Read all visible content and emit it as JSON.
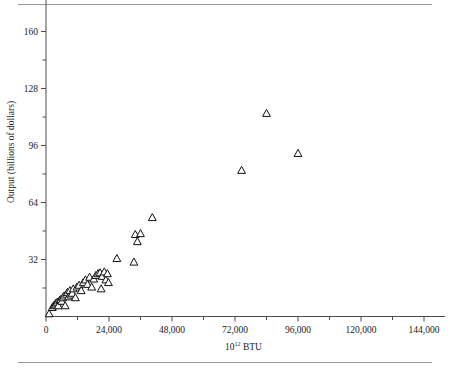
{
  "figure": {
    "has_top_rule": true,
    "has_bottom_rule": true,
    "rule_color": "#9a9a9a",
    "background": "#ffffff"
  },
  "chart_data": {
    "type": "scatter",
    "title": "",
    "subtitle": "",
    "xlabel": "10¹² BTU",
    "xlabel_base": "10",
    "xlabel_exponent": "12",
    "xlabel_unit": "BTU",
    "ylabel": "Output (billions of dollars)",
    "xlim": [
      0,
      152000
    ],
    "ylim": [
      0,
      178
    ],
    "grid": false,
    "legend": null,
    "marker": "open-triangle",
    "marker_fill": "#ffffff",
    "marker_stroke": "#111111",
    "axis_color": "#4d4d4d",
    "xticks": [
      0,
      24000,
      48000,
      72000,
      96000,
      120000,
      144000
    ],
    "xtick_labels": [
      "0",
      "24,000",
      "48,000",
      "72,000",
      "96,000",
      "120,000",
      "144,000"
    ],
    "xticks_minor": [
      12000,
      36000,
      60000,
      84000,
      108000,
      132000
    ],
    "yticks": [
      32,
      64,
      96,
      128,
      160
    ],
    "ytick_labels": [
      "32",
      "64",
      "96",
      "128",
      "160"
    ],
    "yticks_minor": [
      16,
      48,
      80,
      112,
      144
    ],
    "points": [
      {
        "x": 1200,
        "y": 1.5
      },
      {
        "x": 2400,
        "y": 5.0
      },
      {
        "x": 2900,
        "y": 6.0
      },
      {
        "x": 3400,
        "y": 6.5
      },
      {
        "x": 3800,
        "y": 7.5
      },
      {
        "x": 4300,
        "y": 8.0
      },
      {
        "x": 4700,
        "y": 6.0
      },
      {
        "x": 5200,
        "y": 9.0
      },
      {
        "x": 5600,
        "y": 9.5
      },
      {
        "x": 6000,
        "y": 8.5
      },
      {
        "x": 6400,
        "y": 10.5
      },
      {
        "x": 6900,
        "y": 11.5
      },
      {
        "x": 7300,
        "y": 6.0
      },
      {
        "x": 7800,
        "y": 12.5
      },
      {
        "x": 8200,
        "y": 13.5
      },
      {
        "x": 8600,
        "y": 11.0
      },
      {
        "x": 9100,
        "y": 14.5
      },
      {
        "x": 9500,
        "y": 12.0
      },
      {
        "x": 10000,
        "y": 13.0
      },
      {
        "x": 10400,
        "y": 15.5
      },
      {
        "x": 11200,
        "y": 10.5
      },
      {
        "x": 11800,
        "y": 16.5
      },
      {
        "x": 12600,
        "y": 17.5
      },
      {
        "x": 13400,
        "y": 14.5
      },
      {
        "x": 14200,
        "y": 19.0
      },
      {
        "x": 15000,
        "y": 20.5
      },
      {
        "x": 15800,
        "y": 18.0
      },
      {
        "x": 16600,
        "y": 22.0
      },
      {
        "x": 17400,
        "y": 16.5
      },
      {
        "x": 18200,
        "y": 21.0
      },
      {
        "x": 19000,
        "y": 23.0
      },
      {
        "x": 19800,
        "y": 24.0
      },
      {
        "x": 20600,
        "y": 24.5
      },
      {
        "x": 21000,
        "y": 15.5
      },
      {
        "x": 21400,
        "y": 22.5
      },
      {
        "x": 22200,
        "y": 25.0
      },
      {
        "x": 22800,
        "y": 20.5
      },
      {
        "x": 23400,
        "y": 24.0
      },
      {
        "x": 23800,
        "y": 19.0
      },
      {
        "x": 27000,
        "y": 32.5
      },
      {
        "x": 33500,
        "y": 30.5
      },
      {
        "x": 34000,
        "y": 46.0
      },
      {
        "x": 36000,
        "y": 46.5
      },
      {
        "x": 34800,
        "y": 42.0
      },
      {
        "x": 40500,
        "y": 55.5
      },
      {
        "x": 74500,
        "y": 82.0
      },
      {
        "x": 84000,
        "y": 114.0
      },
      {
        "x": 96000,
        "y": 91.5
      }
    ]
  }
}
